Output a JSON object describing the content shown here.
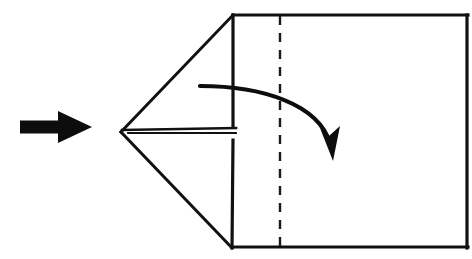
{
  "figure": {
    "title": "Origami fold step diagram",
    "background_color": "#ffffff",
    "ink_color": "#0d0d0d"
  },
  "canvas": {
    "width": 472,
    "height": 259
  },
  "shapes": {
    "square_panel": {
      "name": "square-panel",
      "description": "Main square body of the paper",
      "top_left": [
        233,
        15
      ],
      "top_right": [
        468,
        15
      ],
      "bottom_right": [
        468,
        248
      ],
      "bottom_left": [
        232,
        248
      ],
      "stroke_width": 3.2
    },
    "left_point": {
      "name": "left-triangular-point",
      "description": "Triangular flap narrowing to a point at the left",
      "apex": [
        121,
        132
      ],
      "upper_vertex": [
        233,
        15
      ],
      "lower_vertex": [
        232,
        248
      ],
      "stroke_width": 3.0
    },
    "horizontal_crease": {
      "name": "horizontal-centre-crease",
      "description": "Horizontal fold line running from the apex to the square edge",
      "start": [
        122,
        130
      ],
      "end": [
        236,
        130
      ],
      "stroke_width": 2.6,
      "second_line_offset": 4
    },
    "vertical_dashed_crease": {
      "name": "vertical-dashed-crease",
      "description": "Dashed vertical crease marking the fold position",
      "x": 280,
      "y_start": 16,
      "y_end": 248,
      "stroke_width": 2.4,
      "dash_pattern": "9 8"
    },
    "edge_gap": {
      "name": "square-left-edge-gap",
      "description": "Break in the square's left edge where the horizontal crease meets it",
      "x": 233,
      "gap_start_y": 126,
      "gap_end_y": 140
    }
  },
  "arrows": {
    "direction_arrow": {
      "name": "direction-arrow",
      "label": "Solid pointing arrow at left",
      "tail_x": 20,
      "tip_x": 92,
      "center_y": 127,
      "shaft_height": 13,
      "head_length": 34,
      "head_height": 32,
      "color": "#0d0d0d"
    },
    "fold_arrow": {
      "name": "fold-arrow",
      "label": "Curved fold-over arrow",
      "start": [
        200,
        86
      ],
      "control_1": [
        262,
        86
      ],
      "control_2": [
        318,
        104
      ],
      "end": [
        330,
        146
      ],
      "stroke_width": 4.2,
      "head_tip": [
        333,
        161
      ],
      "head_length": 30,
      "head_width": 18,
      "color": "#0d0d0d"
    }
  }
}
